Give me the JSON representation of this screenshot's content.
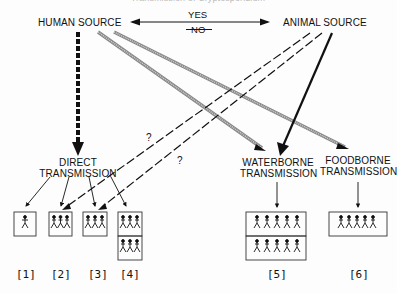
{
  "diagram": {
    "title": "Transmission of Cryptosporidium",
    "sources": {
      "human": "HUMAN SOURCE",
      "animal": "ANIMAL SOURCE"
    },
    "zoonotic_link": {
      "yes": "YES",
      "no": "NO"
    },
    "routes": {
      "direct_line1": "DIRECT",
      "direct_line2": "TRANSMISSION",
      "waterborne_line1": "WATERBORNE",
      "waterborne_line2": "TRANSMISSION",
      "foodborne_line1": "FOODBORNE",
      "foodborne_line2": "TRANSMISSION"
    },
    "uncertain_marks": [
      "?",
      "?"
    ],
    "outcomes": [
      {
        "id": "[1]",
        "people": 1,
        "rows": 1
      },
      {
        "id": "[2]",
        "people": 3,
        "rows": 1
      },
      {
        "id": "[3]",
        "people": 3,
        "rows": 1
      },
      {
        "id": "[4]",
        "people": 3,
        "rows": 2
      },
      {
        "id": "[5]",
        "people": 5,
        "rows": 2
      },
      {
        "id": "[6]",
        "people": 5,
        "rows": 1
      }
    ]
  }
}
